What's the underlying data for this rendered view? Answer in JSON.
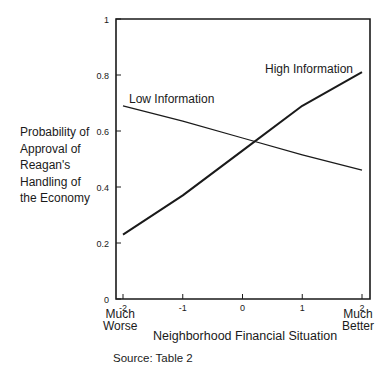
{
  "chart_data": {
    "type": "line",
    "title": "",
    "xlabel": "Neighborhood Financial Situation",
    "ylabel": "Probability of Approval of Reagan's Handling of the Economy",
    "ylabel_lines": [
      "Probability of",
      "Approval of",
      "Reagan's",
      "Handling of",
      "the Economy"
    ],
    "x": [
      -2,
      -1,
      0,
      1,
      2
    ],
    "x_tick_labels": [
      "-2",
      "-1",
      "0",
      "1",
      "2"
    ],
    "x_end_labels": {
      "left": "Much\nWorse",
      "right": "Much\nBetter"
    },
    "y_ticks": [
      0,
      0.2,
      0.4,
      0.6,
      0.8,
      1
    ],
    "y_tick_labels": [
      "0",
      "0.2",
      "0.4",
      "0.6",
      "0.8",
      "1"
    ],
    "xlim": [
      -2,
      2
    ],
    "ylim": [
      0,
      1
    ],
    "grid": false,
    "legend": "inline labels",
    "series": [
      {
        "name": "High Information",
        "values": [
          0.23,
          0.37,
          0.53,
          0.69,
          0.81
        ],
        "label_pos": {
          "x": 265,
          "y": 73
        },
        "width": 2
      },
      {
        "name": "Low Information",
        "values": [
          0.69,
          0.635,
          0.575,
          0.515,
          0.46
        ],
        "label_pos": {
          "x": 129,
          "y": 103
        },
        "width": 1.2
      }
    ],
    "annotations": [
      "Source: Table 2"
    ]
  },
  "source_note": "Source: Table 2",
  "colors": {
    "line": "#1a1a1a",
    "axis": "#1a1a1a"
  }
}
